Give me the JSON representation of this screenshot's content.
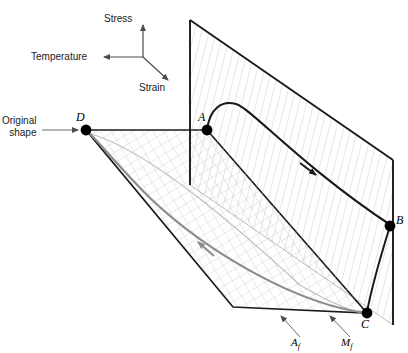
{
  "figure": {
    "kind": "3d-thermomechanical-diagram",
    "axes": {
      "vertical_label": "Stress",
      "left_label": "Temperature",
      "depth_label": "Strain"
    },
    "annotations": {
      "original_shape_line1": "Original",
      "original_shape_line2": "shape"
    },
    "points": [
      {
        "id": "A",
        "label": "A",
        "x": 207,
        "y": 130
      },
      {
        "id": "B",
        "label": "B",
        "x": 390,
        "y": 226
      },
      {
        "id": "C",
        "label": "C",
        "x": 367,
        "y": 313
      },
      {
        "id": "D",
        "label": "D",
        "x": 86,
        "y": 130
      }
    ],
    "transition_temperatures": [
      {
        "id": "Af",
        "base": "A",
        "sub": "f"
      },
      {
        "id": "Mf",
        "base": "M",
        "sub": "f"
      }
    ],
    "colors": {
      "stroke_dark": "#1a1a1a",
      "grid_line": "#b4b4b4",
      "return_path": "#8c8c8c",
      "axis_arrow": "#4d4d4d",
      "point_fill": "#000000",
      "background": "#ffffff"
    }
  }
}
